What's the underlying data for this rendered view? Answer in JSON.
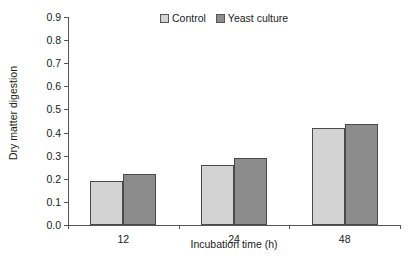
{
  "chart_data": {
    "type": "bar",
    "title": "",
    "xlabel": "Incubation time (h)",
    "ylabel": "Dry matter digestion",
    "categories": [
      "12",
      "24",
      "48"
    ],
    "series": [
      {
        "name": "Control",
        "color": "#d3d3d3",
        "values": [
          0.19,
          0.26,
          0.42
        ]
      },
      {
        "name": "Yeast culture",
        "color": "#8c8c8c",
        "values": [
          0.22,
          0.29,
          0.435
        ]
      }
    ],
    "ylim": [
      0.0,
      0.9
    ],
    "ytick_labels": [
      "0.9",
      "0.8",
      "0.7",
      "0.6",
      "0.5",
      "0.4",
      "0.3",
      "0.2",
      "0.1",
      "0.0"
    ],
    "ytick_values": [
      0.9,
      0.8,
      0.7,
      0.6,
      0.5,
      0.4,
      0.3,
      0.2,
      0.1,
      0.0
    ],
    "grid": false,
    "legend_position": "top-center",
    "axis_color": "#555555"
  },
  "legend": {
    "entries": [
      {
        "label": "Control"
      },
      {
        "label": "Yeast culture"
      }
    ]
  },
  "axes": {
    "y_title": "Dry matter digestion",
    "x_title": "Incubation time (h)"
  }
}
